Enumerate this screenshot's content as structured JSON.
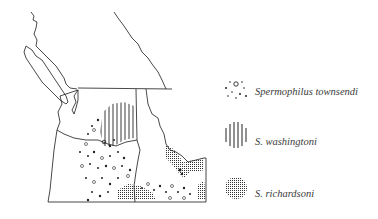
{
  "figure": {
    "type": "distribution-map",
    "region": "Pacific Northwest (Washington, Oregon, Idaho, southern British Columbia)",
    "colors": {
      "line": "#1a1a1a",
      "background": "#ffffff",
      "pattern": "#222222",
      "label": "#3a3a3a"
    }
  },
  "legend": {
    "items": [
      {
        "label": "Spermophilus townsendi",
        "pattern": "dots-and-circles",
        "icon": "dotted-pattern-icon"
      },
      {
        "label": "S. washingtoni",
        "pattern": "vertical-lines",
        "icon": "vertical-stripes-icon"
      },
      {
        "label": "S. richardsoni",
        "pattern": "fine-stipple-grid",
        "icon": "stipple-pattern-icon"
      }
    ]
  }
}
